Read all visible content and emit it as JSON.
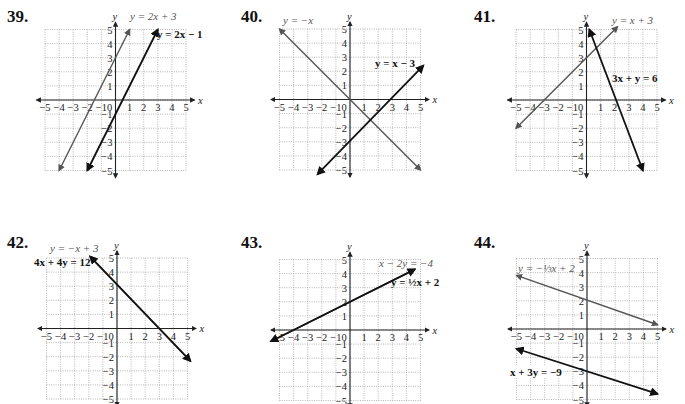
{
  "chart_data": [
    {
      "type": "line",
      "problem": "39.",
      "xlim": [
        -5,
        5
      ],
      "ylim": [
        -5,
        5
      ],
      "xlabel": "x",
      "ylabel": "y",
      "grid": true,
      "x_ticks": [
        "-5",
        "-4",
        "-3",
        "-2",
        "-1",
        "0",
        "1",
        "2",
        "3",
        "4",
        "5"
      ],
      "y_ticks": [
        "5",
        "4",
        "3",
        "2",
        "1",
        "-1",
        "-2",
        "-3",
        "-4",
        "-5"
      ],
      "series": [
        {
          "name": "y = 2x + 3",
          "color": "#555555",
          "bold": false,
          "points": [
            [
              -4,
              -5
            ],
            [
              1,
              5
            ]
          ]
        },
        {
          "name": "y = 2x − 1",
          "color": "#111111",
          "bold": true,
          "points": [
            [
              -2,
              -5
            ],
            [
              3,
              5
            ]
          ]
        }
      ]
    },
    {
      "type": "line",
      "problem": "40.",
      "xlim": [
        -5,
        5
      ],
      "ylim": [
        -5,
        5
      ],
      "xlabel": "x",
      "ylabel": "y",
      "grid": true,
      "x_ticks": [
        "-5",
        "-4",
        "-3",
        "-2",
        "-1",
        "0",
        "1",
        "2",
        "3",
        "4",
        "5"
      ],
      "y_ticks": [
        "5",
        "4",
        "3",
        "2",
        "1",
        "-1",
        "-2",
        "-3",
        "-4",
        "-5"
      ],
      "series": [
        {
          "name": "y = −x",
          "color": "#555555",
          "bold": false,
          "points": [
            [
              -5,
              5
            ],
            [
              5,
              -5
            ]
          ]
        },
        {
          "name": "y = x − 3",
          "color": "#111111",
          "bold": true,
          "points": [
            [
              -2.3,
              -5.3
            ],
            [
              5.2,
              2.4
            ]
          ]
        }
      ]
    },
    {
      "type": "line",
      "problem": "41.",
      "xlim": [
        -5,
        5
      ],
      "ylim": [
        -5,
        5
      ],
      "xlabel": "x",
      "ylabel": "y",
      "grid": true,
      "x_ticks": [
        "-5",
        "-4",
        "-3",
        "-2",
        "-1",
        "0",
        "1",
        "2",
        "3",
        "4",
        "5"
      ],
      "y_ticks": [
        "5",
        "4",
        "3",
        "2",
        "1",
        "-1",
        "-2",
        "-3",
        "-4",
        "-5"
      ],
      "series": [
        {
          "name": "y = x + 3",
          "color": "#555555",
          "bold": false,
          "points": [
            [
              -5,
              -2
            ],
            [
              2.2,
              5.2
            ]
          ]
        },
        {
          "name": "3x + y = 6",
          "color": "#111111",
          "bold": true,
          "points": [
            [
              0.2,
              5
            ],
            [
              4,
              -5
            ]
          ]
        }
      ]
    },
    {
      "type": "line",
      "problem": "42.",
      "xlim": [
        -5,
        5
      ],
      "ylim": [
        -5,
        5
      ],
      "xlabel": "x",
      "ylabel": "y",
      "grid": true,
      "x_ticks": [
        "-5",
        "-4",
        "-3",
        "-2",
        "-1",
        "0",
        "1",
        "2",
        "3",
        "4",
        "5"
      ],
      "y_ticks": [
        "5",
        "4",
        "3",
        "2",
        "1",
        "-1",
        "-2",
        "-3",
        "-4",
        "-5"
      ],
      "series": [
        {
          "name": "y = −x + 3",
          "color": "#555555",
          "bold": false,
          "points": [
            [
              -1.9,
              5.1
            ],
            [
              5.2,
              -2.3
            ]
          ]
        },
        {
          "name": "4x + 4y = 12",
          "color": "#111111",
          "bold": true,
          "points": [
            [
              -1.9,
              5.1
            ],
            [
              5.2,
              -2.3
            ]
          ]
        }
      ]
    },
    {
      "type": "line",
      "problem": "43.",
      "xlim": [
        -5,
        5
      ],
      "ylim": [
        -5,
        5
      ],
      "xlabel": "x",
      "ylabel": "y",
      "grid": true,
      "x_ticks": [
        "-5",
        "-4",
        "-3",
        "-2",
        "-1",
        "0",
        "1",
        "2",
        "3",
        "4",
        "5"
      ],
      "y_ticks": [
        "5",
        "4",
        "3",
        "2",
        "1",
        "-1",
        "-2",
        "-3",
        "-4",
        "-5"
      ],
      "series": [
        {
          "name": "x − 2y = −4",
          "color": "#555555",
          "bold": false,
          "points": [
            [
              -5.6,
              -0.8
            ],
            [
              4.6,
              4.3
            ]
          ]
        },
        {
          "name": "y = ½x + 2",
          "color": "#111111",
          "bold": true,
          "points": [
            [
              -5.6,
              -0.8
            ],
            [
              4.6,
              4.3
            ]
          ]
        }
      ]
    },
    {
      "type": "line",
      "problem": "44.",
      "xlim": [
        -5,
        5
      ],
      "ylim": [
        -5,
        5
      ],
      "xlabel": "x",
      "ylabel": "y",
      "grid": true,
      "x_ticks": [
        "-5",
        "-4",
        "-3",
        "-2",
        "-1",
        "0",
        "1",
        "2",
        "3",
        "4",
        "5"
      ],
      "y_ticks": [
        "5",
        "4",
        "3",
        "2",
        "1",
        "-1",
        "-2",
        "-3",
        "-4",
        "-5"
      ],
      "series": [
        {
          "name": "y = −⅓x + 2",
          "color": "#555555",
          "bold": false,
          "points": [
            [
              -5,
              3.8
            ],
            [
              5,
              0.3
            ]
          ]
        },
        {
          "name": "x + 3y = −9",
          "color": "#111111",
          "bold": true,
          "points": [
            [
              -5,
              -1.4
            ],
            [
              5,
              -4.6
            ]
          ]
        }
      ]
    }
  ],
  "problems": [
    {
      "number": "39.",
      "label_a": "y = 2x + 3",
      "label_b": "y = 2x − 1"
    },
    {
      "number": "40.",
      "label_a": "y = −x",
      "label_b": "y = x − 3"
    },
    {
      "number": "41.",
      "label_a": "y = x + 3",
      "label_b": "3x + y = 6"
    },
    {
      "number": "42.",
      "label_a": "y = −x + 3",
      "label_b": "4x + 4y = 12"
    },
    {
      "number": "43.",
      "label_a": "x − 2y = −4",
      "label_b": "y = ½x + 2"
    },
    {
      "number": "44.",
      "label_a": "y = −⅓x + 2",
      "label_b": "x + 3y = −9"
    }
  ]
}
